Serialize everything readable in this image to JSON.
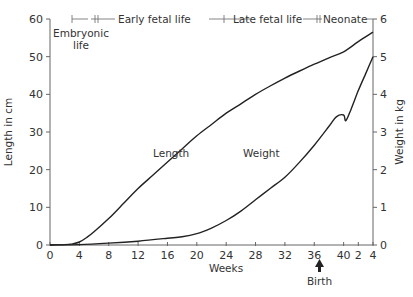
{
  "chart_data": {
    "type": "line",
    "title": "",
    "xlabel": "Weeks",
    "ylabel_left": "Length in cm",
    "ylabel_right": "Weight in kg",
    "x_ticks": [
      "0",
      "4",
      "8",
      "12",
      "16",
      "20",
      "24",
      "28",
      "32",
      "36",
      "40",
      "2",
      "4"
    ],
    "x_tick_positions_weeks": [
      0,
      4,
      8,
      12,
      16,
      20,
      24,
      28,
      32,
      36,
      40,
      42,
      44
    ],
    "note_x": "After week 40 (birth), x ticks count weeks of neonatal life: 2, 4",
    "y_left_ticks": [
      "0",
      "10",
      "20",
      "30",
      "40",
      "50",
      "60"
    ],
    "y_left_range": [
      0,
      60
    ],
    "y_right_ticks": [
      "0",
      "1",
      "2",
      "3",
      "4",
      "5",
      "6"
    ],
    "y_right_range": [
      0,
      6
    ],
    "grid": false,
    "legend": "inline labels",
    "series": [
      {
        "name": "Length",
        "axis": "left",
        "unit": "cm",
        "x": [
          0,
          2,
          3,
          4,
          5,
          6,
          8,
          10,
          12,
          14,
          16,
          18,
          20,
          22,
          24,
          26,
          28,
          30,
          32,
          34,
          36,
          38,
          40,
          42,
          44
        ],
        "values": [
          0,
          0.1,
          0.3,
          0.8,
          2,
          3.5,
          7,
          11,
          15,
          18.5,
          22,
          25.5,
          29,
          32,
          35,
          37.5,
          40,
          42.2,
          44.3,
          46.2,
          48,
          49.7,
          51.3,
          54,
          56.5
        ]
      },
      {
        "name": "Weight",
        "axis": "right",
        "unit": "kg",
        "x": [
          0,
          4,
          8,
          12,
          16,
          18,
          20,
          22,
          24,
          26,
          28,
          30,
          32,
          34,
          36,
          38,
          39,
          40,
          40.3,
          41,
          42,
          43,
          44
        ],
        "values": [
          0,
          0.01,
          0.05,
          0.1,
          0.18,
          0.22,
          0.3,
          0.45,
          0.65,
          0.9,
          1.2,
          1.5,
          1.8,
          2.2,
          2.65,
          3.15,
          3.4,
          3.45,
          3.3,
          3.6,
          4.1,
          4.55,
          5.0
        ]
      }
    ],
    "annotations": {
      "curve_labels": [
        {
          "text": "Length",
          "x_weeks": 17,
          "y_cm": 30
        },
        {
          "text": "Weight",
          "x_weeks": 31,
          "y_cm": 30
        }
      ],
      "periods": [
        {
          "label": "Embryonic life",
          "start_week": 3,
          "end_week": 7
        },
        {
          "label": "Early fetal life",
          "start_week": 7,
          "end_week": 27
        },
        {
          "label": "Late fetal life",
          "start_week": 27,
          "end_week": 40
        },
        {
          "label": "Neonate",
          "start_week": 40,
          "end_week": 44
        }
      ],
      "birth_marker": {
        "label": "Birth",
        "x_week": 40
      }
    }
  },
  "labels": {
    "xlabel": "Weeks",
    "ylabel_left": "Length in cm",
    "ylabel_right": "Weight in kg",
    "length_curve": "Length",
    "weight_curve": "Weight",
    "embryonic_line1": "Embryonic",
    "embryonic_line2": "life",
    "early_fetal": "Early fetal life",
    "late_fetal": "Late fetal life",
    "neonate": "Neonate",
    "birth": "Birth"
  },
  "colors": {
    "curve": "#222222",
    "axis": "#666666",
    "text": "#333333",
    "background": "#ffffff"
  }
}
